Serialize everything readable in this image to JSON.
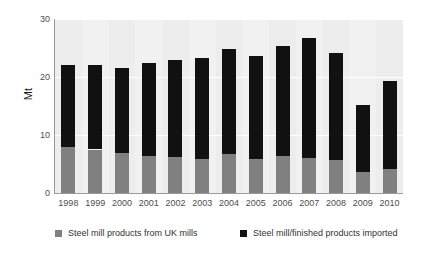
{
  "chart_data": {
    "type": "bar",
    "stacked": true,
    "title": "",
    "subtitle": "",
    "xlabel": "",
    "ylabel": "Mt",
    "categories": [
      "1998",
      "1999",
      "2000",
      "2001",
      "2002",
      "2003",
      "2004",
      "2005",
      "2006",
      "2007",
      "2008",
      "2009",
      "2010"
    ],
    "series": [
      {
        "name": "Steel mill products from UK mills",
        "color": "#808080",
        "values": [
          8.0,
          7.5,
          6.9,
          6.3,
          6.2,
          5.8,
          6.8,
          5.9,
          6.3,
          6.1,
          5.7,
          3.6,
          4.2
        ]
      },
      {
        "name": "Steel mill/finished products imported",
        "color": "#111111",
        "values": [
          14.0,
          14.5,
          14.7,
          16.1,
          16.8,
          17.5,
          18.1,
          17.7,
          19.0,
          20.6,
          18.4,
          11.6,
          15.1
        ]
      }
    ],
    "totals": [
      22.0,
      22.0,
      21.6,
      22.4,
      23.0,
      23.3,
      24.9,
      23.6,
      25.3,
      26.7,
      24.1,
      15.2,
      19.3
    ],
    "ylim": [
      0,
      30
    ],
    "ytick_labels": [
      "0",
      "10",
      "20",
      "30"
    ],
    "ytick_values": [
      0,
      10,
      20,
      30
    ],
    "grid": true,
    "grid_axis": "y",
    "legend_position": "bottom",
    "plot_background": "#f1f1f1",
    "gridline_color": "#ffffff"
  },
  "legend": {
    "entries": [
      {
        "label": "Steel mill products from UK mills"
      },
      {
        "label": "Steel mill/finished products imported"
      }
    ]
  }
}
